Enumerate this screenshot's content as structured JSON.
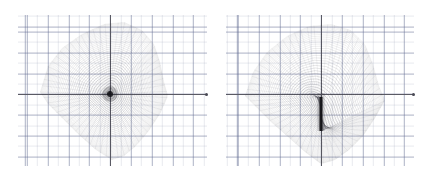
{
  "figure": {
    "title": "",
    "background_color": "#ffffff",
    "width": 430,
    "height": 183,
    "panel_count": 2
  },
  "style": {
    "grid_minor_color": "#7882a0",
    "grid_major_color": "#5a648c",
    "axis_color": "#5a5a64",
    "mesh_color": "#2b2b33",
    "focal_color": "#141418",
    "caustic_color": "#121216"
  },
  "chart_data": [
    {
      "type": "scatter",
      "name": "panel-left",
      "title": "",
      "xlabel": "",
      "ylabel": "",
      "grid": true,
      "legend": null,
      "axes": {
        "origin_px": [
          110,
          94
        ],
        "x_axis_extent_px": [
          18,
          207
        ],
        "y_axis_extent_px": [
          15,
          166
        ],
        "grid_major_spacing_px": 20.8,
        "grid_minor_spacing_px": 10.4,
        "xlim": [
          -4.4,
          4.7
        ],
        "ylim": [
          -3.5,
          3.8
        ]
      },
      "description": "Dense concentric closed-curve mesh forming a teardrop / kite-shaped caustic region with a single dark point-like focus at the origin.",
      "focus": {
        "kind": "point",
        "center_px": [
          110,
          94
        ],
        "radius_px": 3
      },
      "outline_px": [
        [
          40,
          92
        ],
        [
          48,
          66
        ],
        [
          62,
          48
        ],
        [
          82,
          34
        ],
        [
          104,
          24
        ],
        [
          124,
          22
        ],
        [
          142,
          30
        ],
        [
          154,
          44
        ],
        [
          160,
          62
        ],
        [
          164,
          82
        ],
        [
          168,
          96
        ],
        [
          160,
          114
        ],
        [
          148,
          132
        ],
        [
          136,
          146
        ],
        [
          124,
          156
        ],
        [
          112,
          160
        ],
        [
          96,
          150
        ],
        [
          78,
          134
        ],
        [
          62,
          118
        ],
        [
          48,
          104
        ],
        [
          40,
          92
        ]
      ],
      "ring_count": 38,
      "radial_count": 120
    },
    {
      "type": "scatter",
      "name": "panel-right",
      "title": "",
      "xlabel": "",
      "ylabel": "",
      "grid": true,
      "legend": null,
      "axes": {
        "origin_px": [
          106,
          94
        ],
        "x_axis_extent_px": [
          11,
          199
        ],
        "y_axis_extent_px": [
          15,
          166
        ],
        "grid_major_spacing_px": 20.8,
        "grid_minor_spacing_px": 10.4,
        "xlim": [
          -4.4,
          4.7
        ],
        "ylim": [
          -3.5,
          3.8
        ]
      },
      "description": "Dense concentric closed-curve mesh of similar kite shape, but the focus has unfolded into a vertical dark caustic line segment extending downward from the origin.",
      "focus": {
        "kind": "line",
        "center_px": [
          106,
          94
        ],
        "top_px": [
          106,
          97
        ],
        "bottom_px": [
          106,
          131
        ],
        "thickness_px": 3
      },
      "outline_px": [
        [
          30,
          96
        ],
        [
          38,
          72
        ],
        [
          52,
          52
        ],
        [
          72,
          36
        ],
        [
          94,
          26
        ],
        [
          116,
          24
        ],
        [
          136,
          30
        ],
        [
          150,
          44
        ],
        [
          158,
          64
        ],
        [
          164,
          86
        ],
        [
          170,
          100
        ],
        [
          160,
          118
        ],
        [
          148,
          136
        ],
        [
          134,
          150
        ],
        [
          120,
          160
        ],
        [
          106,
          164
        ],
        [
          90,
          152
        ],
        [
          72,
          136
        ],
        [
          56,
          122
        ],
        [
          42,
          108
        ],
        [
          30,
          96
        ]
      ],
      "ring_count": 38,
      "radial_count": 120
    }
  ]
}
